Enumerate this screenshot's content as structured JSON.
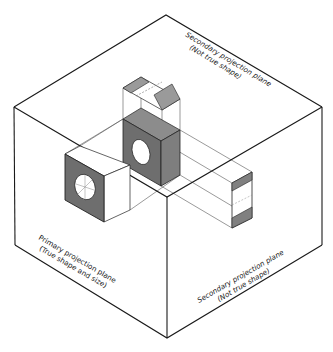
{
  "figure": {
    "type": "isometric-projection-box",
    "colors": {
      "line": "#1a1a1a",
      "thin_line": "#444444",
      "dark_fill": "#6e6e6e",
      "mid_fill": "#8c8c8c",
      "light_fill": "#a8a8a8",
      "background": "#ffffff"
    }
  },
  "labels": {
    "top_plane": {
      "line1": "Secondary projection plane",
      "line2": "(Not true shape)"
    },
    "left_plane": {
      "line1": "Primary projection plane",
      "line2": "(True shape and size)"
    },
    "right_plane": {
      "line1": "Secondary projection plane",
      "line2": "(Not true shape)"
    }
  }
}
